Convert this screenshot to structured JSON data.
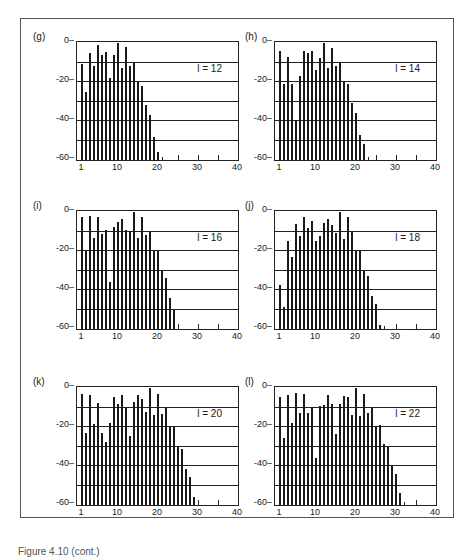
{
  "figure": {
    "caption": "Figure 4.10 (cont.)"
  },
  "chart_data": [
    {
      "type": "bar",
      "panel": "(g)",
      "annotation": "l = 12",
      "xlabel": "",
      "ylabel": "",
      "xlim": [
        0,
        40
      ],
      "ylim": [
        -60,
        0
      ],
      "xticks": [
        "1",
        "10",
        "20",
        "30",
        "40"
      ],
      "yticks": [
        "0",
        "-20",
        "-40",
        "-60"
      ],
      "grid": "horizontal every 10",
      "x": [
        1,
        2,
        3,
        4,
        5,
        6,
        7,
        8,
        9,
        10,
        11,
        12,
        13,
        14,
        15,
        16,
        17,
        18,
        19,
        20
      ],
      "values": [
        -11,
        -25,
        -5,
        -12,
        -1,
        -6,
        -4.5,
        -18,
        -6,
        0,
        -13,
        -2,
        -12,
        -10,
        -20,
        -22,
        -32,
        -37,
        -48,
        -56
      ]
    },
    {
      "type": "bar",
      "panel": "(h)",
      "annotation": "l = 14",
      "xlabel": "",
      "ylabel": "",
      "xlim": [
        0,
        40
      ],
      "ylim": [
        -60,
        0
      ],
      "xticks": [
        "1",
        "10",
        "20",
        "30",
        "40"
      ],
      "yticks": [
        "0",
        "-20",
        "-40",
        "-60"
      ],
      "grid": "horizontal every 10",
      "x": [
        1,
        2,
        3,
        4,
        5,
        6,
        7,
        8,
        9,
        10,
        11,
        12,
        13,
        14,
        15,
        16,
        17,
        18,
        19,
        20,
        21,
        22
      ],
      "values": [
        -4,
        -21,
        -7,
        -21,
        -40,
        -17,
        -4,
        -5,
        -4,
        -14,
        -7.5,
        0,
        -13,
        -2.5,
        -12,
        -10,
        -20,
        -21,
        -31,
        -36,
        -47,
        -52
      ]
    },
    {
      "type": "bar",
      "panel": "(i)",
      "annotation": "l = 16",
      "xlabel": "",
      "ylabel": "",
      "xlim": [
        0,
        40
      ],
      "ylim": [
        -60,
        0
      ],
      "xticks": [
        "1",
        "10",
        "20",
        "30",
        "40"
      ],
      "yticks": [
        "0",
        "-20",
        "-40",
        "-60"
      ],
      "grid": "horizontal every 10",
      "x": [
        1,
        2,
        3,
        4,
        5,
        6,
        7,
        8,
        9,
        10,
        11,
        12,
        13,
        14,
        15,
        16,
        17,
        18,
        19,
        20,
        21,
        22,
        23,
        24
      ],
      "values": [
        -2.5,
        -20,
        -2,
        -13.5,
        -2.5,
        -11.5,
        -9,
        -36,
        -7.5,
        -5,
        -3.5,
        -9,
        -9.5,
        0,
        -13.5,
        -2.5,
        -12,
        -9.5,
        -20,
        -20,
        -30,
        -34,
        -44,
        -50
      ]
    },
    {
      "type": "bar",
      "panel": "(j)",
      "annotation": "l = 18",
      "xlabel": "",
      "ylabel": "",
      "xlim": [
        0,
        40
      ],
      "ylim": [
        -60,
        0
      ],
      "xticks": [
        "1",
        "10",
        "20",
        "30",
        "40"
      ],
      "yticks": [
        "0",
        "-20",
        "-40",
        "-60"
      ],
      "grid": "horizontal every 10",
      "x": [
        1,
        2,
        3,
        4,
        5,
        6,
        7,
        8,
        9,
        10,
        11,
        12,
        13,
        14,
        15,
        16,
        17,
        18,
        19,
        20,
        21,
        22,
        23,
        24,
        25,
        26
      ],
      "values": [
        -37.5,
        -48.5,
        -15,
        -23,
        -6,
        -12.5,
        -2.5,
        -8,
        -4.5,
        -15,
        -12.5,
        -5.5,
        -3.5,
        -6.5,
        -11,
        0,
        -14,
        -2.5,
        -10,
        -20,
        -20,
        -30,
        -33,
        -43,
        -47,
        -58
      ]
    },
    {
      "type": "bar",
      "panel": "(k)",
      "annotation": "l = 20",
      "xlabel": "",
      "ylabel": "",
      "xlim": [
        0,
        40
      ],
      "ylim": [
        -60,
        0
      ],
      "xticks": [
        "1",
        "10",
        "20",
        "30",
        "40"
      ],
      "yticks": [
        "0",
        "-20",
        "-40",
        "-60"
      ],
      "grid": "horizontal every 10",
      "x": [
        1,
        2,
        3,
        4,
        5,
        6,
        7,
        8,
        9,
        10,
        11,
        12,
        13,
        14,
        15,
        16,
        17,
        18,
        19,
        20,
        21,
        22,
        23,
        24,
        25,
        26,
        27,
        28,
        29
      ],
      "values": [
        -3,
        -23,
        -3.5,
        -18.5,
        -7.5,
        -23,
        -27.5,
        -18,
        -4.5,
        -8,
        -3.5,
        -10,
        -24.5,
        -7,
        -3.5,
        -5.5,
        -12.5,
        0,
        -14,
        -3,
        -13.5,
        -9.5,
        -19.5,
        -19.5,
        -29.5,
        -31.5,
        -41.5,
        -45.5,
        -56
      ]
    },
    {
      "type": "bar",
      "panel": "(l)",
      "annotation": "l = 22",
      "xlabel": "",
      "ylabel": "",
      "xlim": [
        0,
        40
      ],
      "ylim": [
        -60,
        0
      ],
      "xticks": [
        "1",
        "10",
        "20",
        "30",
        "40"
      ],
      "yticks": [
        "0",
        "-20",
        "-40",
        "-60"
      ],
      "grid": "horizontal every 10",
      "x": [
        1,
        2,
        3,
        4,
        5,
        6,
        7,
        8,
        9,
        10,
        11,
        12,
        13,
        14,
        15,
        16,
        17,
        18,
        19,
        20,
        21,
        22,
        23,
        24,
        25,
        26,
        27,
        28,
        29,
        30,
        31
      ],
      "values": [
        -4.5,
        -25.5,
        -3.5,
        -18,
        -2.5,
        -13,
        -3,
        -13,
        -9.5,
        -36,
        -9,
        -8.5,
        -3.5,
        -8,
        -23.5,
        -8,
        -4,
        -4.5,
        -14,
        0,
        -14.5,
        -3,
        -13,
        -9.5,
        -19.5,
        -19,
        -28.5,
        -30,
        -40,
        -44,
        -54
      ]
    }
  ],
  "layout": {
    "panels": [
      {
        "left": 33,
        "top": 36,
        "plot_left": 43,
        "plot_top": 5
      },
      {
        "left": 245,
        "top": 36,
        "plot_left": 29,
        "plot_top": 5
      },
      {
        "left": 33,
        "top": 205,
        "plot_left": 43,
        "plot_top": 5
      },
      {
        "left": 245,
        "top": 205,
        "plot_left": 29,
        "plot_top": 5
      },
      {
        "left": 33,
        "top": 381,
        "plot_left": 43,
        "plot_top": 5
      },
      {
        "left": 245,
        "top": 381,
        "plot_left": 29,
        "plot_top": 5
      }
    ]
  }
}
